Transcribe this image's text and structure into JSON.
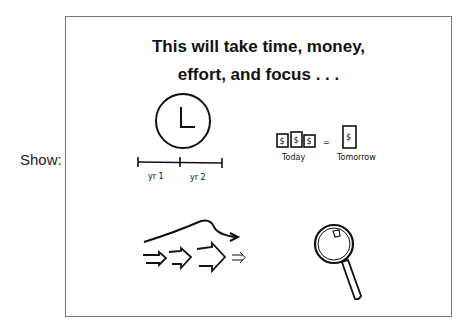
{
  "side_label": "Show:",
  "slide": {
    "title_line1": "This will take time, money,",
    "title_line2": "effort, and focus . . .",
    "illustrations": {
      "time": {
        "icon": "clock-icon",
        "timeline_labels": [
          "yr 1",
          "yr 2"
        ]
      },
      "money": {
        "icon": "dollar-bills-icon",
        "equals": "=",
        "today_label": "Today",
        "tomorrow_label": "Tomorrow",
        "bill_symbol": "$"
      },
      "effort": {
        "icon": "arrows-effort-icon"
      },
      "focus": {
        "icon": "magnifying-glass-icon"
      }
    }
  }
}
